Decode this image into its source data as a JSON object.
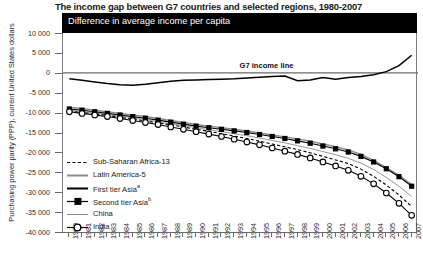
{
  "title": "The income gap between G7 countries and selected regions, 1980-2007",
  "banner_label": "Difference in average income per capita",
  "y_axis_title": "Purchasing power parity (PPP), current United States dollars",
  "annotation": "G7 income line",
  "legend": [
    {
      "label": "Sub-Saharan Africa-13",
      "sup": "",
      "style": "dashed-black",
      "color": "#000000"
    },
    {
      "label": "Latin America-5",
      "sup": "",
      "style": "solid-gray-thick",
      "color": "#8c8c8c"
    },
    {
      "label": "First tier Asia",
      "sup": "a",
      "style": "solid-black-thick",
      "color": "#000000"
    },
    {
      "label": "Second tier Asia",
      "sup": "b",
      "style": "solid-black-square",
      "color": "#000000"
    },
    {
      "label": "China",
      "sup": "",
      "style": "solid-gray-thin",
      "color": "#8c8c8c"
    },
    {
      "label": "India",
      "sup": "",
      "style": "solid-black-circle",
      "color": "#000000"
    }
  ],
  "chart_data": {
    "type": "line",
    "title": "The income gap between G7 countries and selected regions, 1980-2007",
    "subtitle": "Difference in average income per capita",
    "xlabel": "",
    "ylabel": "Purchasing power parity (PPP), current United States dollars",
    "ylim": [
      -40000,
      10000
    ],
    "yticks": [
      10000,
      5000,
      0,
      -5000,
      -10000,
      -15000,
      -20000,
      -25000,
      -30000,
      -35000,
      -40000
    ],
    "ytick_labels": [
      "10 000",
      "5 000",
      "0",
      "-5 000",
      "-10 000",
      "-15 000",
      "-20 000",
      "-25 000",
      "-30 000",
      "-35 000",
      "-40 000"
    ],
    "grid": false,
    "legend_position": "inside-lower-left",
    "reference_line": {
      "value": 0,
      "label": "G7 income line"
    },
    "x": [
      1980,
      1981,
      1982,
      1983,
      1984,
      1985,
      1986,
      1987,
      1988,
      1989,
      1990,
      1991,
      1992,
      1993,
      1994,
      1995,
      1996,
      1997,
      1998,
      1999,
      2000,
      2001,
      2002,
      2003,
      2004,
      2005,
      2006,
      2007
    ],
    "series": [
      {
        "name": "Sub-Saharan Africa-13",
        "values": [
          -9600,
          -10000,
          -10300,
          -10700,
          -11200,
          -11600,
          -12100,
          -12600,
          -13100,
          -13600,
          -14200,
          -14700,
          -15300,
          -15900,
          -16500,
          -17200,
          -17900,
          -18600,
          -19300,
          -20100,
          -21000,
          -21900,
          -22800,
          -24200,
          -26000,
          -28200,
          -30700,
          -33600
        ]
      },
      {
        "name": "Latin America-5",
        "values": [
          -8700,
          -9000,
          -9400,
          -9800,
          -10200,
          -10600,
          -11000,
          -11500,
          -12000,
          -12500,
          -13000,
          -13400,
          -13800,
          -14200,
          -14600,
          -15100,
          -15600,
          -16100,
          -16600,
          -17200,
          -17900,
          -18600,
          -19400,
          -20500,
          -22000,
          -23800,
          -25800,
          -28100
        ]
      },
      {
        "name": "First tier Asia",
        "values": [
          -1500,
          -1900,
          -2300,
          -2700,
          -3000,
          -3100,
          -2900,
          -2500,
          -2100,
          -1900,
          -1800,
          -1700,
          -1600,
          -1500,
          -1300,
          -1100,
          -900,
          -800,
          -2000,
          -1800,
          -1200,
          -1600,
          -1200,
          -900,
          -500,
          300,
          1800,
          4400
        ]
      },
      {
        "name": "Second tier Asia",
        "values": [
          -9100,
          -9400,
          -9800,
          -10200,
          -10600,
          -11000,
          -11400,
          -11900,
          -12400,
          -12900,
          -13400,
          -13800,
          -14200,
          -14600,
          -15000,
          -15500,
          -16000,
          -16500,
          -17100,
          -17700,
          -18400,
          -19100,
          -19900,
          -21000,
          -22400,
          -24100,
          -26100,
          -28500
        ]
      },
      {
        "name": "China",
        "values": [
          -9400,
          -9700,
          -10100,
          -10500,
          -10900,
          -11300,
          -11800,
          -12300,
          -12800,
          -13300,
          -13800,
          -14300,
          -14800,
          -15300,
          -15800,
          -16400,
          -17000,
          -17600,
          -18300,
          -19000,
          -19800,
          -20600,
          -21500,
          -22700,
          -24300,
          -26300,
          -28500,
          -31100
        ]
      },
      {
        "name": "India",
        "values": [
          -9800,
          -10200,
          -10600,
          -11000,
          -11500,
          -12000,
          -12500,
          -13000,
          -13600,
          -14200,
          -14800,
          -15400,
          -16000,
          -16700,
          -17400,
          -18100,
          -18900,
          -19700,
          -20500,
          -21400,
          -22400,
          -23400,
          -24500,
          -26000,
          -27900,
          -30200,
          -32800,
          -35800
        ]
      }
    ]
  }
}
